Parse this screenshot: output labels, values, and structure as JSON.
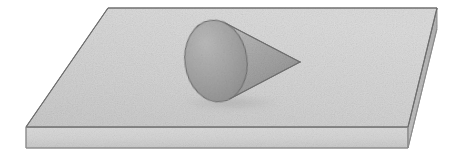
{
  "figure": {
    "background_color": "#ffffff",
    "width": 460,
    "height": 155,
    "texture": "grainy-paper-noise",
    "labels": [],
    "caption": ""
  },
  "palette": {
    "background": "#ffffff",
    "slab_top_fill": "#d2d2d2",
    "slab_top_fill_light": "#dcdcdc",
    "slab_top_fill_dark": "#c6c6c6",
    "slab_front_fill": "#d7d7d7",
    "slab_front_fill_dark": "#c9c9c9",
    "slab_side_fill": "#bdbdbd",
    "cone_body_light": "#c2c2c2",
    "cone_body_mid": "#a8a8a8",
    "cone_body_dark": "#8f8f8f",
    "cone_base_light": "#b4b4b4",
    "cone_base_mid": "#a3a3a3",
    "cone_base_dark": "#8d8d8d",
    "outline": "#6e6e6e",
    "outline_soft": "#8a8a8a"
  },
  "geometry": {
    "slab": {
      "name": "rectangular-slab",
      "top_face_points": "108,8 437,8 408,127 26,127",
      "front_face_points": "26,127 408,127 408,148 26,148",
      "side_face_points": "437,8 437,28 408,148 408,127",
      "top_face_corners": {
        "back_left": [
          108,
          8
        ],
        "back_right": [
          437,
          8
        ],
        "front_right": [
          408,
          127
        ],
        "front_left": [
          26,
          127
        ]
      },
      "thickness_px": 21
    },
    "cone": {
      "name": "cone",
      "apex": [
        300,
        62
      ],
      "base_center": [
        216,
        61
      ],
      "base_rx": 31,
      "base_ry": 41,
      "base_rotation_deg": -8,
      "body_points": "300,62 199,22 193,27 189,40 190,56 196,76 206,93 216,101 227,102",
      "contact_shadow_center": [
        231,
        103
      ],
      "contact_shadow_rx": 52,
      "contact_shadow_ry": 7
    }
  },
  "scene": {
    "objects": [
      {
        "id": "slab",
        "label": "slab",
        "kind": "rectangular-plate"
      },
      {
        "id": "cone",
        "label": "cone",
        "kind": "right-circular-cone"
      }
    ]
  }
}
